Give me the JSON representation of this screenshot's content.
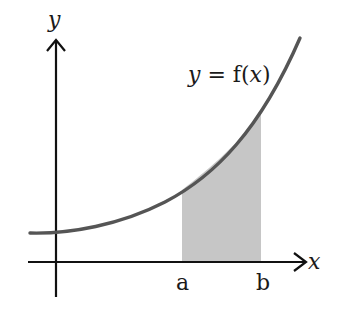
{
  "diagram": {
    "type": "definite-integral-area",
    "axes": {
      "x_label": "x",
      "y_label": "y"
    },
    "curve": {
      "label_lhs": "y",
      "label_eq": " = ",
      "label_fn": "f(",
      "label_var": "x",
      "label_close": ")",
      "color": "#555555"
    },
    "bounds": {
      "lower": "a",
      "upper": "b"
    },
    "shade_color": "#c8c8c8",
    "axis_color": "#111111"
  }
}
